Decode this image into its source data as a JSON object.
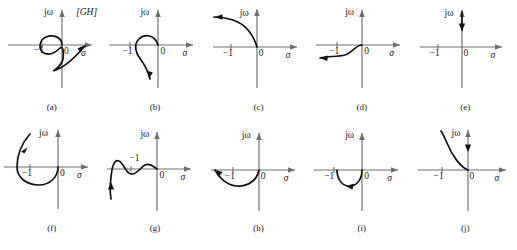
{
  "figure": {
    "title_tag": "[GH]",
    "axis_labels": {
      "imaginary": "jω",
      "real": "σ",
      "origin": "0",
      "minus_one": "−1"
    },
    "panels": [
      {
        "id": "a",
        "caption": "(a)",
        "curve_name": "loop-encircling-minus-one",
        "description": "small circle around −1 joined to large lower arc sweeping right with arrowhead",
        "has_gh_tag": true,
        "minus_one_label_position": "below-axis"
      },
      {
        "id": "b",
        "caption": "(b)",
        "curve_name": "hook-from-origin-downward",
        "description": "curve loops up-left from origin then descends below axis with arrowhead pointing down-left",
        "has_gh_tag": false,
        "minus_one_label_position": "below-axis"
      },
      {
        "id": "c",
        "caption": "(c)",
        "curve_name": "arc-upper-left-from-origin",
        "description": "curve rises from origin into second quadrant flattening leftward with left arrowhead",
        "has_gh_tag": false,
        "minus_one_label_position": "below-axis"
      },
      {
        "id": "d",
        "caption": "(d)",
        "curve_name": "s-curve-lower-left-from-origin",
        "description": "S-shaped curve from origin dipping below axis toward the left with left arrowhead",
        "has_gh_tag": false,
        "minus_one_label_position": "below-axis"
      },
      {
        "id": "e",
        "caption": "(e)",
        "curve_name": "vertical-segment-on-imaginary-axis",
        "description": "straight segment along the positive imaginary axis with up and down arrowheads",
        "has_gh_tag": false,
        "minus_one_label_position": "below-axis"
      },
      {
        "id": "f",
        "caption": "(f)",
        "curve_name": "large-loop-around-minus-one",
        "description": "large loop from origin sweeping below and around −1 up into second quadrant with arrowhead",
        "has_gh_tag": false,
        "minus_one_label_position": "below-axis"
      },
      {
        "id": "g",
        "caption": "(g)",
        "curve_name": "oscillating-wave-from-origin",
        "description": "wavy curve from origin oscillating leftward then plunging down with upward arrowhead",
        "has_gh_tag": false,
        "minus_one_label_position": "above-axis"
      },
      {
        "id": "h",
        "caption": "(h)",
        "curve_name": "shallow-arc-below-axis",
        "description": "shallow arc from origin dipping below the axis past −1 with left arrowhead",
        "has_gh_tag": false,
        "minus_one_label_position": "below-axis"
      },
      {
        "id": "i",
        "caption": "(i)",
        "curve_name": "small-semicircle-below-axis",
        "description": "small semicircular loop below the axis between −1 and 0 with arrowhead",
        "has_gh_tag": false,
        "minus_one_label_position": "below-axis"
      },
      {
        "id": "j",
        "caption": "(j)",
        "curve_name": "asymptotic-curve-to-imaginary-axis",
        "description": "curve from origin rising steeply near the imaginary axis with down arrowhead on axis",
        "has_gh_tag": false,
        "minus_one_label_position": "below-axis"
      }
    ]
  }
}
